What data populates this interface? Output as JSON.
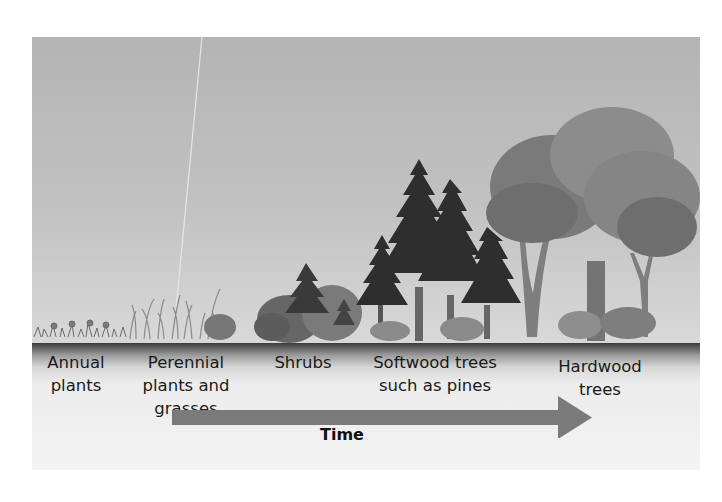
{
  "diagram": {
    "stages": [
      {
        "id": "annual",
        "label": "Annual\nplants"
      },
      {
        "id": "perennial",
        "label": "Perennial\nplants and\ngrasses"
      },
      {
        "id": "shrubs",
        "label": "Shrubs"
      },
      {
        "id": "softwood",
        "label": "Softwood trees\nsuch as pines"
      },
      {
        "id": "hardwood",
        "label": "Hardwood\ntrees"
      }
    ],
    "arrow": {
      "label": "Time",
      "direction": "right",
      "color": "#7a7a7a"
    },
    "colors": {
      "sky": "#bdbdbd",
      "ground": "#3a3a3a",
      "pine": "#2e2e2e",
      "hardwood_canopy": "#7a7a7a",
      "shrub": "#666666"
    }
  }
}
